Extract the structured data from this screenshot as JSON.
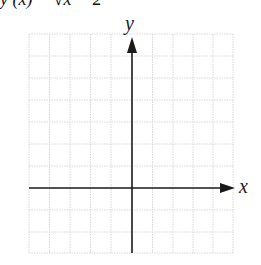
{
  "header": {
    "equation_cut": "f(x) = − √x − 2",
    "equation_display": "y (x)      − √x  − 2"
  },
  "axes": {
    "x_label": "x",
    "y_label": "y"
  },
  "grid": {
    "columns": 10,
    "rows": 11,
    "line_color": "#d9d9d9",
    "axis_color": "#1a1a1a"
  }
}
